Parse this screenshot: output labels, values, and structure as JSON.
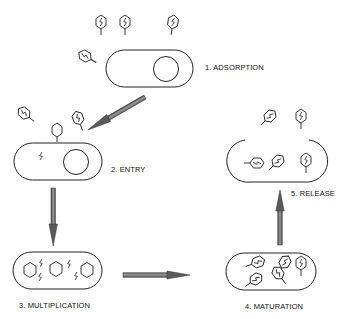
{
  "stages": [
    {
      "id": 1,
      "label": "1. ADSORPTION"
    },
    {
      "id": 2,
      "label": "2. ENTRY"
    },
    {
      "id": 3,
      "label": "3. MULTIPLICATION"
    },
    {
      "id": 4,
      "label": "4. MATURATION"
    },
    {
      "id": 5,
      "label": "5. RELEASE"
    }
  ],
  "colors": {
    "line": "#222222",
    "arrow_fill": "#7a7a7a",
    "arrow_dark": "#3a3a3a",
    "background": "#ffffff"
  }
}
